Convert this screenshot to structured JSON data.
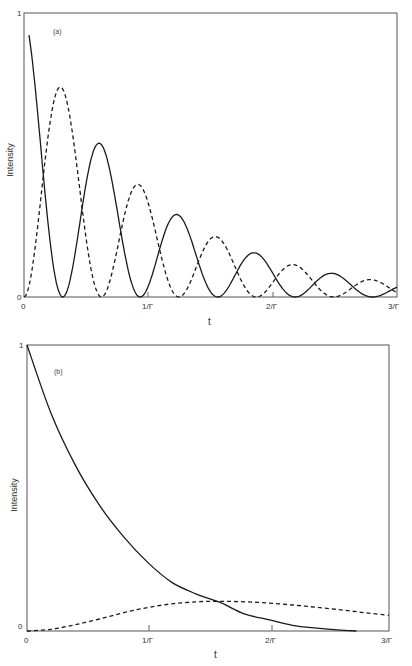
{
  "chart_data": [
    {
      "type": "line",
      "panel_label": "(a)",
      "title": "",
      "xlabel": "t",
      "ylabel": "Intensity",
      "xlim": [
        0,
        3
      ],
      "ylim": [
        0,
        1
      ],
      "xticks": [
        0,
        1,
        2,
        3
      ],
      "xtick_labels": [
        "0",
        "1/Γ",
        "2/Γ",
        "3/Γ"
      ],
      "yticks": [
        0,
        1
      ],
      "ytick_labels": [
        "0",
        "1"
      ],
      "grid": false,
      "legend": null,
      "series": [
        {
          "name": "solid",
          "style": "solid",
          "description": "damped oscillation, e^{-Γt}·cos²(πt/0.623)",
          "x": [
            0.04,
            0.1,
            0.2,
            0.31,
            0.4,
            0.5,
            0.62,
            0.75,
            0.85,
            0.93,
            1.05,
            1.15,
            1.24,
            1.35,
            1.45,
            1.56,
            1.66,
            1.76,
            1.87,
            1.98,
            2.08,
            2.18,
            2.28,
            2.39,
            2.49,
            2.6,
            2.7,
            2.8,
            2.9,
            3.0
          ],
          "values": [
            0.96,
            0.79,
            0.4,
            0.0,
            0.17,
            0.45,
            0.54,
            0.19,
            0.02,
            0.01,
            0.14,
            0.29,
            0.29,
            0.15,
            0.03,
            0.0,
            0.04,
            0.13,
            0.15,
            0.07,
            0.01,
            0.01,
            0.05,
            0.09,
            0.08,
            0.04,
            0.01,
            0.0,
            0.01,
            0.03
          ]
        },
        {
          "name": "dashed",
          "style": "dashed",
          "description": "damped oscillation, e^{-Γt}·sin²(πt/0.623)",
          "x": [
            0.0,
            0.1,
            0.2,
            0.31,
            0.4,
            0.5,
            0.62,
            0.75,
            0.85,
            0.93,
            1.05,
            1.15,
            1.24,
            1.35,
            1.45,
            1.56,
            1.66,
            1.76,
            1.87,
            1.98,
            2.08,
            2.18,
            2.28,
            2.39,
            2.49,
            2.6,
            2.7,
            2.8,
            2.9,
            3.0
          ],
          "values": [
            0.0,
            0.23,
            0.42,
            0.73,
            0.5,
            0.16,
            0.0,
            0.28,
            0.41,
            0.39,
            0.21,
            0.03,
            0.0,
            0.11,
            0.21,
            0.21,
            0.15,
            0.04,
            0.0,
            0.07,
            0.12,
            0.1,
            0.05,
            0.0,
            0.0,
            0.04,
            0.06,
            0.06,
            0.04,
            0.02
          ]
        }
      ]
    },
    {
      "type": "line",
      "panel_label": "(b)",
      "title": "",
      "xlabel": "t",
      "ylabel": "Intensity",
      "xlim": [
        0,
        3
      ],
      "ylim": [
        0,
        1
      ],
      "xticks": [
        0,
        1,
        2,
        3
      ],
      "xtick_labels": [
        "0",
        "1/Γ",
        "2/Γ",
        "3/Γ"
      ],
      "yticks": [
        0,
        1
      ],
      "ytick_labels": [
        "0",
        "1"
      ],
      "grid": false,
      "legend": null,
      "series": [
        {
          "name": "solid",
          "style": "solid",
          "description": "monotonic decay",
          "x": [
            0.0,
            0.2,
            0.4,
            0.6,
            0.8,
            1.0,
            1.2,
            1.4,
            1.6,
            1.8,
            2.0,
            2.2,
            2.4,
            2.6,
            2.73
          ],
          "values": [
            1.0,
            0.76,
            0.58,
            0.44,
            0.33,
            0.24,
            0.17,
            0.13,
            0.1,
            0.06,
            0.04,
            0.02,
            0.01,
            0.003,
            0.0
          ]
        },
        {
          "name": "dashed",
          "style": "dashed",
          "description": "slow rise to ~0.1 then slow decay",
          "x": [
            0.0,
            0.2,
            0.4,
            0.6,
            0.8,
            1.0,
            1.2,
            1.4,
            1.6,
            1.8,
            2.0,
            2.2,
            2.4,
            2.6,
            2.8,
            3.0
          ],
          "values": [
            0.0,
            0.006,
            0.022,
            0.042,
            0.064,
            0.082,
            0.095,
            0.102,
            0.104,
            0.102,
            0.098,
            0.091,
            0.083,
            0.074,
            0.064,
            0.055
          ]
        }
      ]
    }
  ],
  "panels": [
    {
      "label": "(a)",
      "ylabel": "Intensity",
      "xlabel": "t",
      "y_top": "1",
      "y_bottom": "0",
      "ticks": [
        "0",
        "1/Γ",
        "2/Γ",
        "3/Γ"
      ]
    },
    {
      "label": "(b)",
      "ylabel": "Intensity",
      "xlabel": "t",
      "y_top": "1",
      "y_bottom": "0",
      "ticks": [
        "0",
        "1/Γ",
        "2/Γ",
        "3/Γ"
      ]
    }
  ]
}
